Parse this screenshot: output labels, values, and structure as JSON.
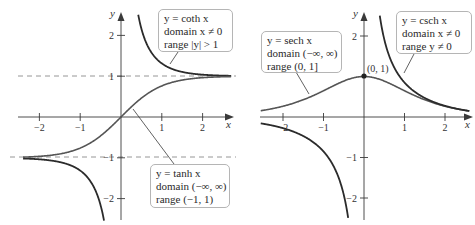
{
  "chart_data": [
    {
      "type": "line",
      "panel": "left",
      "series": [
        {
          "name": "y = coth x",
          "function": "coth",
          "domain": "x ≠ 0",
          "range": "|y| > 1"
        },
        {
          "name": "y = tanh x",
          "function": "tanh",
          "domain": "(−∞, ∞)",
          "range": "(−1, 1)"
        }
      ],
      "asymptotes": [
        1,
        -1
      ],
      "xlabel": "x",
      "ylabel": "y",
      "xticks": [
        -2,
        -1,
        1,
        2
      ],
      "yticks": [
        2,
        1,
        -1,
        -2
      ],
      "xlim": [
        -2.7,
        2.7
      ],
      "ylim": [
        -2.4,
        2.7
      ]
    },
    {
      "type": "line",
      "panel": "right",
      "series": [
        {
          "name": "y = sech x",
          "function": "sech",
          "domain": "(−∞, ∞)",
          "range": "(0, 1]"
        },
        {
          "name": "y = csch x",
          "function": "csch",
          "domain": "x ≠ 0",
          "range": "y ≠ 0"
        }
      ],
      "point": {
        "label": "(0, 1)",
        "x": 0,
        "y": 1
      },
      "xlabel": "x",
      "ylabel": "y",
      "xticks": [
        -2,
        -1,
        1,
        2
      ],
      "yticks": [
        2,
        1,
        -1,
        -2
      ],
      "xlim": [
        -2.7,
        2.7
      ],
      "ylim": [
        -2.4,
        2.7
      ]
    }
  ],
  "left": {
    "coth_box": {
      "line1": "y = coth x",
      "line2": "domain x ≠ 0",
      "line3": "range |y| > 1"
    },
    "tanh_box": {
      "line1": "y = tanh x",
      "line2": "domain (−∞, ∞)",
      "line3": "range (−1, 1)"
    },
    "axis_x": "x",
    "axis_y": "y",
    "ticks_x": [
      "−2",
      "−1",
      "1",
      "2"
    ],
    "ticks_y": [
      "2",
      "1",
      "−1",
      "−2"
    ]
  },
  "right": {
    "sech_box": {
      "line1": "y = sech x",
      "line2": "domain (−∞, ∞)",
      "line3": "range (0, 1]"
    },
    "csch_box": {
      "line1": "y = csch x",
      "line2": "domain x ≠ 0",
      "line3": "range y ≠ 0"
    },
    "point_label": "(0, 1)",
    "axis_x": "x",
    "axis_y": "y",
    "ticks_x": [
      "−2",
      "−1",
      "1",
      "2"
    ],
    "ticks_y": [
      "2",
      "1",
      "−1",
      "−2"
    ]
  }
}
